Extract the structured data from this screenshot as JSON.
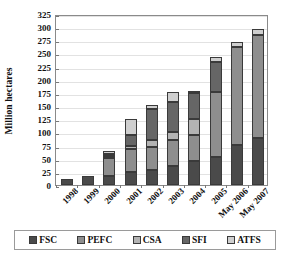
{
  "chart_data": {
    "type": "bar",
    "subtype": "stacked",
    "title": "",
    "xlabel": "",
    "ylabel": "Million hectares",
    "ylim": [
      0,
      325
    ],
    "ytick_step": 25,
    "yticks": [
      0,
      25,
      50,
      75,
      100,
      125,
      150,
      175,
      200,
      225,
      250,
      275,
      300,
      325
    ],
    "grid": true,
    "legend_position": "bottom",
    "categories": [
      "1998",
      "1999",
      "2000",
      "2001",
      "2002",
      "2003",
      "2004",
      "2005",
      "May 2006",
      "May 2007"
    ],
    "series": [
      {
        "name": "FSC",
        "color": "#4a4a4a",
        "values": [
          11,
          17,
          18,
          25,
          29,
          36,
          45,
          54,
          77,
          90
        ]
      },
      {
        "name": "PEFC",
        "color": "#8e8e8e",
        "values": [
          0,
          0,
          33,
          44,
          44,
          49,
          51,
          123,
          185,
          196
        ]
      },
      {
        "name": "CSA",
        "color": "#b3b3b3",
        "values": [
          0,
          0,
          4,
          6,
          13,
          15,
          30,
          0,
          0,
          0
        ]
      },
      {
        "name": "SFI",
        "color": "#666666",
        "values": [
          0,
          0,
          4,
          20,
          58,
          57,
          48,
          57,
          0,
          0
        ]
      },
      {
        "name": "ATFS",
        "color": "#cfcfcf",
        "values": [
          0,
          0,
          5,
          30,
          8,
          20,
          3,
          9,
          10,
          10
        ]
      }
    ],
    "totals": [
      11,
      17,
      64,
      125,
      152,
      177,
      177,
      243,
      272,
      296
    ],
    "legend_entries": [
      "FSC",
      "PEFC",
      "CSA",
      "SFI",
      "ATFS"
    ]
  },
  "colors": {
    "frame": "#8a8a8a",
    "grid": "#e2e2e2",
    "bar_edge": "#3a3a3a",
    "background": "#ffffff"
  }
}
